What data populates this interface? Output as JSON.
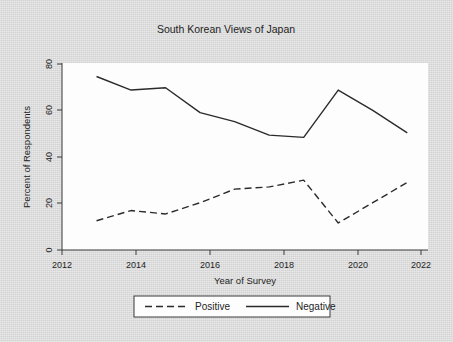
{
  "chart_data": {
    "type": "line",
    "title": "South Korean Views of Japan",
    "xlabel": "Year of Survey",
    "ylabel": "Percent of Respondents",
    "x": [
      2013,
      2014,
      2015,
      2016,
      2017,
      2018,
      2019,
      2020,
      2021,
      2022
    ],
    "xlim": [
      2012,
      2022.6
    ],
    "ylim": [
      0,
      83
    ],
    "xticks": [
      2012,
      2014,
      2016,
      2018,
      2020,
      2022
    ],
    "xtick_labels": [
      "2012",
      "2014",
      "2016",
      "2018",
      "2020",
      "2022"
    ],
    "yticks": [
      0,
      20,
      40,
      60,
      80
    ],
    "ytick_labels": [
      "0",
      "20",
      "40",
      "60",
      "80"
    ],
    "grid": false,
    "legend_position": "below-axes",
    "series": [
      {
        "name": "Positive",
        "style": "dashed",
        "color": "#2b2b2b",
        "values": [
          13,
          17.5,
          16,
          21,
          27,
          28,
          31,
          12,
          21,
          30
        ]
      },
      {
        "name": "Negative",
        "style": "solid",
        "color": "#2b2b2b",
        "values": [
          77,
          71,
          72,
          61,
          57,
          51,
          50,
          71,
          62,
          52
        ]
      }
    ]
  },
  "legend": {
    "entries": [
      {
        "label": "Positive",
        "style": "dashed"
      },
      {
        "label": "Negative",
        "style": "solid"
      }
    ]
  },
  "colors": {
    "figure_background": "#d9d9d9",
    "plot_background": "#fdfdfd",
    "ink": "#2b2b2b"
  }
}
